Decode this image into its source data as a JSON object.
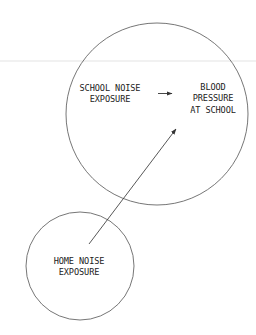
{
  "diagram": {
    "type": "causal-diagram",
    "nodes": [
      {
        "id": "school_noise",
        "lines": [
          "SCHOOL NOISE",
          "EXPOSURE"
        ]
      },
      {
        "id": "blood_pressure",
        "lines": [
          "BLOOD",
          "PRESSURE",
          "AT SCHOOL"
        ]
      },
      {
        "id": "home_noise",
        "lines": [
          "HOME NOISE",
          "EXPOSURE"
        ]
      }
    ],
    "edges": [
      {
        "from": "school_noise",
        "to": "blood_pressure"
      },
      {
        "from": "home_noise",
        "to": "blood_pressure"
      }
    ],
    "containers": [
      {
        "id": "school_circle",
        "contains": [
          "school_noise",
          "blood_pressure"
        ]
      },
      {
        "id": "home_circle",
        "contains": [
          "home_noise"
        ]
      }
    ],
    "colors": {
      "line": "#555555",
      "text": "#222222",
      "background": "#ffffff"
    }
  }
}
